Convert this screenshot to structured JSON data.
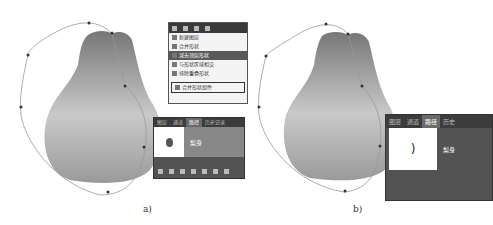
{
  "figure_a": {
    "caption": "a)",
    "menu": {
      "items": [
        {
          "label": "新建图层",
          "active": false
        },
        {
          "label": "合并形状",
          "active": false
        },
        {
          "label": "减去顶层形状",
          "active": true
        },
        {
          "label": "与形状区域相交",
          "active": false
        },
        {
          "label": "排除重叠形状",
          "active": false
        },
        {
          "label": "合并形状组件",
          "active": false,
          "boxed": true
        }
      ]
    },
    "panel": {
      "tabs": [
        "图层",
        "通道",
        "路径",
        "历史记录"
      ],
      "selected_tab": "路径",
      "path_name": "梨身"
    }
  },
  "figure_b": {
    "caption": "b)",
    "panel": {
      "tabs": [
        "图层",
        "通道",
        "路径",
        "历史"
      ],
      "selected_tab": "路径",
      "path_name": "梨身"
    }
  },
  "colors": {
    "pear_top": "#7a7a7a",
    "pear_bottom": "#d0d0d0",
    "panel_bg": "#535353",
    "path_line": "#888888"
  }
}
